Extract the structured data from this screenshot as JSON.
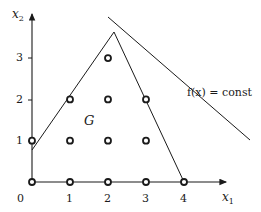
{
  "diagram": {
    "axes": {
      "x_label": "x",
      "x_sub": "1",
      "y_label": "x",
      "y_sub": "2",
      "x_ticks": [
        "0",
        "1",
        "2",
        "3",
        "4"
      ],
      "y_ticks": [
        "1",
        "2",
        "3"
      ]
    },
    "region_label": "G",
    "objective_label": "f(x) = const",
    "lattice_points": [
      [
        0,
        0
      ],
      [
        1,
        0
      ],
      [
        2,
        0
      ],
      [
        3,
        0
      ],
      [
        4,
        0
      ],
      [
        0,
        1
      ],
      [
        1,
        1
      ],
      [
        2,
        1
      ],
      [
        3,
        1
      ],
      [
        1,
        2
      ],
      [
        2,
        2
      ],
      [
        3,
        2
      ],
      [
        2,
        3
      ]
    ],
    "polygon": {
      "vertices": [
        [
          0,
          0
        ],
        [
          0,
          1.5
        ],
        [
          2.15,
          3.65
        ],
        [
          4,
          0
        ]
      ]
    },
    "objective_line": {
      "from": [
        2.0,
        4.0
      ],
      "to": [
        5.7,
        1.0
      ]
    },
    "colors": {
      "stroke": "#1a1a1a",
      "background": "#ffffff"
    }
  }
}
